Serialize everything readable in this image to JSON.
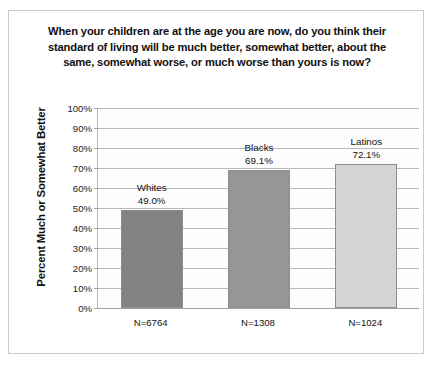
{
  "chart_data": {
    "type": "bar",
    "title": "When your children are at the age you are now, do you think their standard of living will be much better, somewhat better, about the same, somewhat worse, or much worse than yours is now?",
    "ylabel": "Percent Much or Somewhat Better",
    "xlabel": "",
    "categories": [
      "Whites",
      "Blacks",
      "Latinos"
    ],
    "values": [
      49.0,
      69.1,
      72.1
    ],
    "value_labels": [
      "49.0%",
      "69.1%",
      "72.1%"
    ],
    "sample_sizes": [
      "N=6764",
      "N=1308",
      "N=1024"
    ],
    "bar_colors": [
      "#828282",
      "#969696",
      "#d4d4d4"
    ],
    "ylim": [
      0,
      100
    ],
    "ytick_labels": [
      "0%",
      "10%",
      "20%",
      "30%",
      "40%",
      "50%",
      "60%",
      "70%",
      "80%",
      "90%",
      "100%"
    ],
    "ytick_values": [
      0,
      10,
      20,
      30,
      40,
      50,
      60,
      70,
      80,
      90,
      100
    ],
    "grid": true,
    "legend": "none"
  }
}
